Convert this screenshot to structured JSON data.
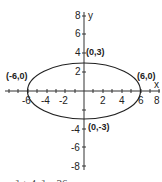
{
  "diagram": {
    "axes": {
      "x_label": "x",
      "y_label": "y"
    },
    "x_ticks": [
      "-6",
      "-4",
      "-2",
      "2",
      "4",
      "6",
      "8"
    ],
    "y_ticks": [
      "8",
      "6",
      "4",
      "2",
      "-4",
      "-6",
      "-8"
    ],
    "points": [
      {
        "label": "(0,3)"
      },
      {
        "label": "(-6,0)"
      },
      {
        "label": "(6,0)"
      },
      {
        "label": "(0,-3)"
      }
    ],
    "equation": "x² + 4y² = 36",
    "shape": "ellipse",
    "semi_major": 6,
    "semi_minor": 3
  }
}
